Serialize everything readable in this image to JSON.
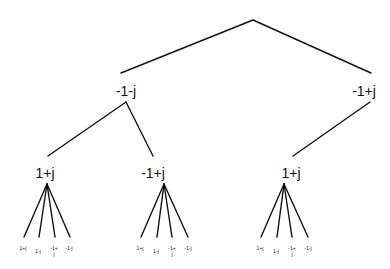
{
  "tree": {
    "root": {
      "label": ""
    },
    "level1": [
      {
        "label": "-1-j"
      },
      {
        "label": "-1+j"
      }
    ],
    "level2": [
      {
        "label": "1+j",
        "parent": 0
      },
      {
        "label": "-1+j",
        "parent": 0
      },
      {
        "label": "1+j",
        "parent": 1
      }
    ],
    "leaves": [
      [
        "1+j",
        "1-j",
        "-1+j",
        "-1-j"
      ],
      [
        "1+j",
        "1-j",
        "-1+j",
        "-1-j"
      ],
      [
        "1+j",
        "1-j",
        "-1+j",
        "-1-j"
      ]
    ]
  }
}
